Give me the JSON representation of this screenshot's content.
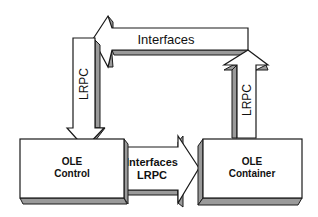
{
  "diagram": {
    "top_arrow": {
      "label": "Interfaces",
      "direction": "left"
    },
    "left_arrow": {
      "label": "LRPC",
      "direction": "down"
    },
    "right_arrow": {
      "label": "LRPC",
      "direction": "up"
    },
    "middle_arrow": {
      "line1": "Interfaces",
      "line2": "LRPC",
      "direction": "right"
    },
    "left_box": {
      "line1": "OLE",
      "line2": "Control"
    },
    "right_box": {
      "line1": "OLE",
      "line2": "Container"
    }
  },
  "colors": {
    "fill": "#ffffff",
    "shadow": "#9a9a9a",
    "stroke": "#1a1a1a"
  }
}
